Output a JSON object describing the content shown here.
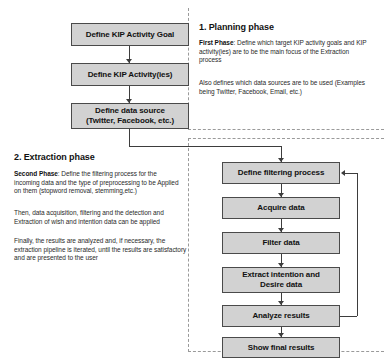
{
  "diagram": {
    "type": "flowchart",
    "fill_color": "#d2d2d2",
    "border_color": "#4a4a4a",
    "accent_color": "#3d3d3d"
  },
  "planning": {
    "heading": "1. Planning phase",
    "paragraphs": [
      {
        "lead": "First Phase",
        "text": ": Define which target KIP activity goals and KIP activity(ies) are to be the main focus of the Extraction process"
      },
      {
        "lead": "",
        "text": "Also defines which data sources are to be used (Examples being Twitter, Facebook, Email, etc.)"
      }
    ],
    "nodes": [
      {
        "id": "define-kip-activity-goal",
        "label": "Define KIP Activity Goal"
      },
      {
        "id": "define-kip-activities",
        "label": "Define KIP Activity(ies)"
      },
      {
        "id": "define-data-source",
        "line1": "Define data source",
        "line2": "(Twitter, Facebook, etc.)"
      }
    ]
  },
  "extraction": {
    "heading": "2. Extraction phase",
    "paragraphs": [
      {
        "lead": "Second Phase",
        "text": ": Define the filtering process for the incoming data and the type of preprocessing to be Applied on them (stopword removal, stemming,etc.)"
      },
      {
        "lead": "",
        "text": "Then, data acquisition, filtering and the detection and Extraction of wish and intention data can be applied"
      },
      {
        "lead": "",
        "text": "Finally, the results are analyzed and, if necessary, the extraction pipeline is iterated, until the results are satisfactory and are presented to the user"
      }
    ],
    "nodes": [
      {
        "id": "define-filtering-process",
        "label": "Define filtering process"
      },
      {
        "id": "acquire-data",
        "label": "Acquire data"
      },
      {
        "id": "filter-data",
        "label": "Filter data"
      },
      {
        "id": "extract-intention-desire-data",
        "line1": "Extract intention and",
        "line2": "Desire data"
      },
      {
        "id": "analyze-results",
        "label": "Analyze results"
      },
      {
        "id": "show-final-results",
        "label": "Show final results"
      }
    ],
    "feedback_loop": {
      "from": "analyze-results",
      "to": "define-filtering-process",
      "label": ""
    }
  }
}
